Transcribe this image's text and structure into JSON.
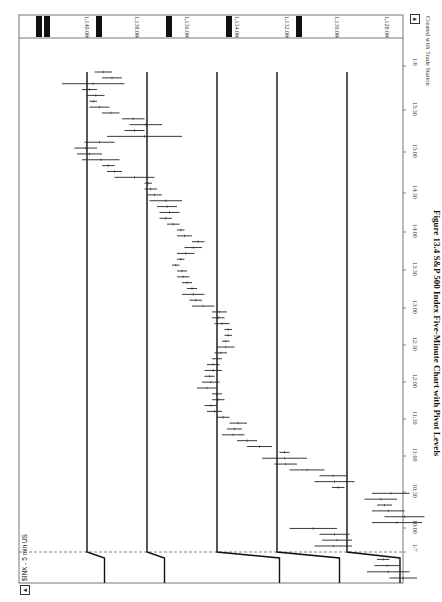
{
  "chart_data": {
    "type": "bar",
    "title": "$INX - 5 min US",
    "subtitle": "OHLC 5-minute bars with horizontal pivot levels (chart rotated 90°)",
    "xlabel": "Time",
    "ylabel": "Price",
    "price_ticks": [
      "1,140.00",
      "1,138.00",
      "1,136.00",
      "1,134.00",
      "1,132.00",
      "1,130.00",
      "1,128.00"
    ],
    "price_tick_values": [
      1140,
      1138,
      1136,
      1134,
      1132,
      1130,
      1128
    ],
    "time_ticks": [
      "1/7",
      "10:00",
      "10:30",
      "11:00",
      "11:30",
      "12:00",
      "12:30",
      "13:00",
      "13:30",
      "14:00",
      "14:30",
      "15:00",
      "15:30",
      "1/8"
    ],
    "ylim": [
      1127.5,
      1141.5
    ],
    "grid": false,
    "legend": null,
    "pivot_levels_day2": [
      1140.0,
      1137.6,
      1134.8,
      1132.4,
      1129.6
    ],
    "pivot_levels_day1": [
      1139.3,
      1136.9,
      1132.3,
      1129.9,
      1125.5
    ],
    "bars": [
      {
        "t": "1/7 15:40",
        "low": 1126.8,
        "high": 1127.9
      },
      {
        "t": "1/7 15:45",
        "low": 1127.1,
        "high": 1128.8
      },
      {
        "t": "1/7 15:50",
        "low": 1127.5,
        "high": 1128.5
      },
      {
        "t": "1/7 15:55",
        "low": 1127.9,
        "high": 1128.4
      },
      {
        "t": "09:35",
        "low": 1129.4,
        "high": 1130.9
      },
      {
        "t": "09:40",
        "low": 1129.4,
        "high": 1130.6
      },
      {
        "t": "09:45",
        "low": 1129.5,
        "high": 1130.7
      },
      {
        "t": "09:50",
        "low": 1130.0,
        "high": 1131.9
      },
      {
        "t": "09:55",
        "low": 1126.6,
        "high": 1128.6
      },
      {
        "t": "10:00",
        "low": 1126.5,
        "high": 1128.1
      },
      {
        "t": "10:05",
        "low": 1127.3,
        "high": 1128.6
      },
      {
        "t": "10:10",
        "low": 1127.8,
        "high": 1128.4
      },
      {
        "t": "10:15",
        "low": 1127.6,
        "high": 1128.9
      },
      {
        "t": "10:20",
        "low": 1127.1,
        "high": 1128.6
      },
      {
        "t": "10:25",
        "low": 1129.7,
        "high": 1130.2
      },
      {
        "t": "10:30",
        "low": 1129.3,
        "high": 1130.9
      },
      {
        "t": "10:35",
        "low": 1129.6,
        "high": 1130.7
      },
      {
        "t": "10:40",
        "low": 1130.5,
        "high": 1131.9
      },
      {
        "t": "10:45",
        "low": 1131.6,
        "high": 1132.5
      },
      {
        "t": "10:50",
        "low": 1131.2,
        "high": 1133.0
      },
      {
        "t": "10:55",
        "low": 1131.9,
        "high": 1132.3
      },
      {
        "t": "11:00",
        "low": 1132.6,
        "high": 1133.6
      },
      {
        "t": "11:05",
        "low": 1133.2,
        "high": 1134.0
      },
      {
        "t": "11:10",
        "low": 1133.7,
        "high": 1134.6
      },
      {
        "t": "11:15",
        "low": 1133.8,
        "high": 1134.4
      },
      {
        "t": "11:20",
        "low": 1133.6,
        "high": 1134.3
      },
      {
        "t": "11:25",
        "low": 1134.3,
        "high": 1134.8
      },
      {
        "t": "11:30",
        "low": 1134.6,
        "high": 1135.2
      },
      {
        "t": "11:35",
        "low": 1134.8,
        "high": 1135.3
      },
      {
        "t": "11:40",
        "low": 1134.5,
        "high": 1135.0
      },
      {
        "t": "11:45",
        "low": 1134.6,
        "high": 1135.0
      },
      {
        "t": "11:50",
        "low": 1134.8,
        "high": 1135.6
      },
      {
        "t": "11:55",
        "low": 1134.7,
        "high": 1135.4
      },
      {
        "t": "12:00",
        "low": 1134.9,
        "high": 1135.3
      },
      {
        "t": "12:05",
        "low": 1134.6,
        "high": 1135.3
      },
      {
        "t": "12:10",
        "low": 1134.7,
        "high": 1135.2
      },
      {
        "t": "12:15",
        "low": 1134.6,
        "high": 1135.0
      },
      {
        "t": "12:20",
        "low": 1134.4,
        "high": 1134.9
      },
      {
        "t": "12:25",
        "low": 1134.1,
        "high": 1134.8
      },
      {
        "t": "12:30",
        "low": 1134.3,
        "high": 1134.6
      },
      {
        "t": "12:35",
        "low": 1134.2,
        "high": 1134.5
      },
      {
        "t": "12:40",
        "low": 1134.2,
        "high": 1134.5
      },
      {
        "t": "12:45",
        "low": 1134.3,
        "high": 1134.9
      },
      {
        "t": "12:50",
        "low": 1134.5,
        "high": 1135.0
      },
      {
        "t": "12:55",
        "low": 1134.4,
        "high": 1135.0
      },
      {
        "t": "13:00",
        "low": 1134.9,
        "high": 1135.8
      },
      {
        "t": "13:05",
        "low": 1135.4,
        "high": 1135.9
      },
      {
        "t": "13:10",
        "low": 1135.3,
        "high": 1136.2
      },
      {
        "t": "13:15",
        "low": 1135.6,
        "high": 1136.0
      },
      {
        "t": "13:20",
        "low": 1135.8,
        "high": 1136.2
      },
      {
        "t": "13:25",
        "low": 1135.9,
        "high": 1136.4
      },
      {
        "t": "13:30",
        "low": 1136.0,
        "high": 1136.4
      },
      {
        "t": "13:35",
        "low": 1136.3,
        "high": 1136.6
      },
      {
        "t": "13:40",
        "low": 1136.1,
        "high": 1136.4
      },
      {
        "t": "13:45",
        "low": 1135.7,
        "high": 1136.4
      },
      {
        "t": "13:50",
        "low": 1135.4,
        "high": 1136.1
      },
      {
        "t": "13:55",
        "low": 1135.3,
        "high": 1135.8
      },
      {
        "t": "14:00",
        "low": 1135.8,
        "high": 1136.4
      },
      {
        "t": "14:05",
        "low": 1136.1,
        "high": 1136.4
      },
      {
        "t": "14:10",
        "low": 1136.3,
        "high": 1136.8
      },
      {
        "t": "14:15",
        "low": 1136.6,
        "high": 1137.1
      },
      {
        "t": "14:20",
        "low": 1136.3,
        "high": 1137.1
      },
      {
        "t": "14:25",
        "low": 1136.4,
        "high": 1137.2
      },
      {
        "t": "14:30",
        "low": 1136.2,
        "high": 1137.5
      },
      {
        "t": "14:35",
        "low": 1137.0,
        "high": 1137.6
      },
      {
        "t": "14:40",
        "low": 1137.2,
        "high": 1137.7
      },
      {
        "t": "14:45",
        "low": 1137.4,
        "high": 1137.7
      },
      {
        "t": "14:50",
        "low": 1137.3,
        "high": 1138.9
      },
      {
        "t": "14:55",
        "low": 1138.6,
        "high": 1139.2
      },
      {
        "t": "15:00",
        "low": 1138.9,
        "high": 1139.4
      },
      {
        "t": "15:05",
        "low": 1138.7,
        "high": 1140.2
      },
      {
        "t": "15:10",
        "low": 1139.4,
        "high": 1140.4
      },
      {
        "t": "15:15",
        "low": 1139.6,
        "high": 1140.5
      },
      {
        "t": "15:20",
        "low": 1138.9,
        "high": 1140.1
      },
      {
        "t": "15:25",
        "low": 1136.2,
        "high": 1139.2
      },
      {
        "t": "15:30",
        "low": 1137.7,
        "high": 1138.5
      },
      {
        "t": "15:35",
        "low": 1137.0,
        "high": 1138.3
      },
      {
        "t": "15:40",
        "low": 1137.7,
        "high": 1138.6
      },
      {
        "t": "15:45",
        "low": 1138.7,
        "high": 1139.4
      },
      {
        "t": "15:50",
        "low": 1139.1,
        "high": 1139.9
      },
      {
        "t": "15:55",
        "low": 1139.6,
        "high": 1139.9
      },
      {
        "t": "1/8 09:35",
        "low": 1139.3,
        "high": 1140.0
      },
      {
        "t": "1/8 09:40",
        "low": 1139.6,
        "high": 1140.2
      },
      {
        "t": "1/8 09:45",
        "low": 1138.5,
        "high": 1141.0
      },
      {
        "t": "1/8 09:50",
        "low": 1138.6,
        "high": 1139.4
      },
      {
        "t": "1/8 09:55",
        "low": 1139.0,
        "high": 1139.7
      }
    ]
  },
  "chart": {
    "symbol_label": "$INX - 5 min US",
    "credit": "Created with Trade Station",
    "caption": "Figure 13.4   S&P 500 Index Five-Minute Chart with Pivot Levels",
    "colors": {
      "bar": "#222222",
      "line": "#111111",
      "marker": "#111111",
      "frame": "#555555",
      "background": "#ffffff"
    },
    "nav_left": "◂",
    "nav_right": "▸"
  }
}
